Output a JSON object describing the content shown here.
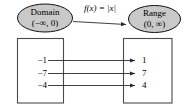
{
  "diagram": {
    "title_function_label": "f(x) = |x|",
    "domain_node": {
      "name": "Domain",
      "interval": "(−∞, 0)"
    },
    "range_node": {
      "name": "Range",
      "interval": "(0, ∞)"
    },
    "mapping": {
      "inputs": [
        "−1",
        "−7",
        "−4"
      ],
      "outputs": [
        "1",
        "7",
        "4"
      ]
    },
    "colors": {
      "ellipse_fill": "#c9c9c9",
      "ellipse_stroke": "#111111",
      "box_stroke": "#4a4a4a",
      "arrow": "#2b2b2b",
      "background": "#ffffff"
    }
  }
}
